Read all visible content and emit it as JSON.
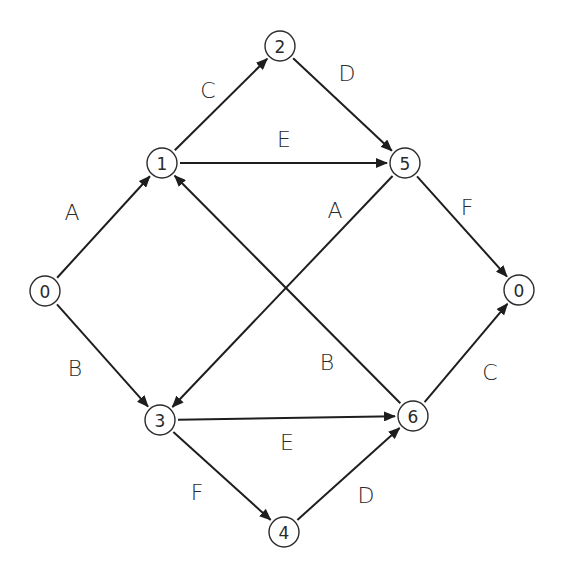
{
  "diagram": {
    "type": "directed-graph",
    "nodes": [
      {
        "id": "n0L",
        "label": "0",
        "x": 45,
        "y": 291
      },
      {
        "id": "n1",
        "label": "1",
        "x": 162,
        "y": 163
      },
      {
        "id": "n2",
        "label": "2",
        "x": 280,
        "y": 46
      },
      {
        "id": "n5",
        "label": "5",
        "x": 405,
        "y": 163
      },
      {
        "id": "n0R",
        "label": "0",
        "x": 519,
        "y": 290
      },
      {
        "id": "n3",
        "label": "3",
        "x": 160,
        "y": 420
      },
      {
        "id": "n6",
        "label": "6",
        "x": 413,
        "y": 416
      },
      {
        "id": "n4",
        "label": "4",
        "x": 284,
        "y": 532
      }
    ],
    "edges": [
      {
        "from": "n0L",
        "to": "n1",
        "label": "A",
        "lx": 72,
        "ly": 212
      },
      {
        "from": "n1",
        "to": "n2",
        "label": "C",
        "lx": 208,
        "ly": 90
      },
      {
        "from": "n2",
        "to": "n5",
        "label": "D",
        "lx": 347,
        "ly": 73
      },
      {
        "from": "n1",
        "to": "n5",
        "label": "E",
        "lx": 284,
        "ly": 139
      },
      {
        "from": "n5",
        "to": "n0R",
        "label": "F",
        "lx": 467,
        "ly": 207
      },
      {
        "from": "n5",
        "to": "n3",
        "label": "A",
        "lx": 335,
        "ly": 210
      },
      {
        "from": "n6",
        "to": "n1",
        "label": "B",
        "lx": 327,
        "ly": 362
      },
      {
        "from": "n0L",
        "to": "n3",
        "label": "B",
        "lx": 75,
        "ly": 368
      },
      {
        "from": "n3",
        "to": "n6",
        "label": "E",
        "lx": 287,
        "ly": 442
      },
      {
        "from": "n3",
        "to": "n4",
        "label": "F",
        "lx": 197,
        "ly": 492
      },
      {
        "from": "n4",
        "to": "n6",
        "label": "D",
        "lx": 366,
        "ly": 495
      },
      {
        "from": "n6",
        "to": "n0R",
        "label": "C",
        "lx": 490,
        "ly": 372
      }
    ],
    "node_radius": 15,
    "colors": {
      "stroke": "#1e1e1e",
      "text": "#2a2a2a",
      "background": "#ffffff"
    }
  }
}
